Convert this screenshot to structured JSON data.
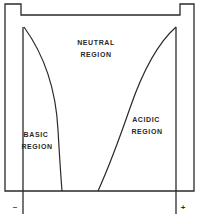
{
  "diagram": {
    "type": "electrolysis-cell-ph-regions",
    "stroke_color": "#2a2a2a",
    "background_color": "#ffffff",
    "regions": {
      "neutral": {
        "line1": "NEUTRAL",
        "line2": "REGION"
      },
      "basic": {
        "line1": "BASIC",
        "line2": "REGION"
      },
      "acidic": {
        "line1": "ACIDIC",
        "line2": "REGION"
      }
    },
    "electrodes": {
      "negative": {
        "sign": "–"
      },
      "positive": {
        "sign": "+"
      }
    }
  }
}
